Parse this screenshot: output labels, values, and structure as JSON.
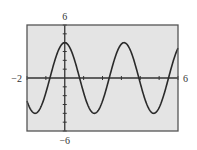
{
  "chart_data": {
    "type": "line",
    "title": "",
    "xlabel": "",
    "ylabel": "",
    "xlim": [
      -2,
      6
    ],
    "ylim": [
      -6,
      6
    ],
    "window_labels": {
      "xmin": "−2",
      "xmax": "6",
      "ymin": "−6",
      "ymax": "6"
    },
    "xtick_step": 1,
    "ytick_step": 1,
    "grid": false,
    "legend": "none",
    "series": [
      {
        "name": "y = 4cos(2x)",
        "function": "4*cos(2*x)",
        "amplitude": 4,
        "period": 3.1416,
        "x": [
          -2,
          -1.5,
          -1,
          -0.5,
          0,
          0.5,
          1,
          1.5,
          2,
          2.5,
          3,
          3.5,
          4,
          4.5,
          5,
          5.5,
          6
        ],
        "values": [
          -2.61,
          -3.96,
          -1.66,
          2.16,
          4.0,
          2.16,
          -1.66,
          -3.96,
          -0.58,
          1.13,
          3.84,
          3.02,
          -0.58,
          -3.64,
          -3.36,
          0.18,
          3.38
        ]
      }
    ],
    "colors": {
      "plot_background": "#e4e4e4",
      "frame": "#555555",
      "axes": "#333333",
      "curve": "#2a2a2a"
    }
  }
}
